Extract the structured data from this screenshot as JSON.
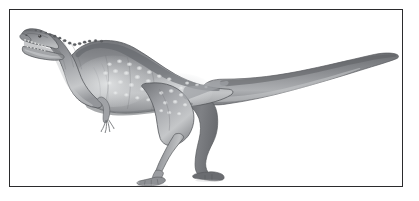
{
  "figure": {
    "kind": "scientific-illustration",
    "subject_label": "Abelisaurid theropod dinosaur in left-facing lateral profile",
    "caption": "",
    "title": "",
    "rendering": "grayscale pencil and airbrush shading",
    "background_color": "#ffffff",
    "page_background_color": "#ffffff"
  },
  "frame": {
    "label": "illustration border",
    "border_color": "#2b2b2d",
    "border_width_px": 1.6,
    "x": 9,
    "y": 9,
    "width": 394,
    "height": 178,
    "fill": "#ffffff"
  },
  "palette": {
    "outline": "#4a4a4c",
    "body_dark": "#6f7073",
    "body_mid": "#8e9093",
    "body_light": "#b4b6b8",
    "body_highlight": "#d2d4d5",
    "belly_shadow": "#7b7d80",
    "spot_color": "#e0e2e3",
    "tooth_color": "#f2f2f2",
    "eye_color": "#3a3a3c",
    "claw_color": "#9a9c9e"
  },
  "anatomy": {
    "parts": [
      {
        "name": "skull",
        "label": "Skull with open jaws",
        "note": "boxy abelisaurid skull, rugose upper surface"
      },
      {
        "name": "upper-jaw",
        "label": "Upper jaw",
        "note": "angled upward, lined with conical teeth"
      },
      {
        "name": "lower-jaw",
        "label": "Lower jaw",
        "note": "dropped open, gape roughly 45 degrees"
      },
      {
        "name": "eye",
        "label": "Eye",
        "note": "small dark dot behind the nares"
      },
      {
        "name": "neck",
        "label": "Neck",
        "note": "thick, S-curved, bearing a row of low dorsal bumps"
      },
      {
        "name": "torso",
        "label": "Torso",
        "note": "barrel chest, light speckled flank pattern"
      },
      {
        "name": "forelimb",
        "label": "Forelimb",
        "note": "very short arm with four stubby clawed digits"
      },
      {
        "name": "near-hindlimb",
        "label": "Near hind limb",
        "note": "forward, weight-bearing, three-toed foot"
      },
      {
        "name": "far-hindlimb",
        "label": "Far hind limb",
        "note": "rear, partially shaded, three-toed foot"
      },
      {
        "name": "tail",
        "label": "Tail",
        "note": "long, thick-based, tapering to a fine point at the right"
      },
      {
        "name": "dorsal-ridge",
        "label": "Dorsal ridge",
        "note": "row of small osteoderm-like bumps over the neck and shoulders"
      },
      {
        "name": "flank-spots",
        "label": "Flank spots",
        "note": "rows of pale oval spots over the ribs, hip and thigh"
      }
    ],
    "orientation": "facing left",
    "pose": "standing, striding, mouth open"
  },
  "composition": {
    "subject_bounds": {
      "x": 24,
      "y": 26,
      "width": 368,
      "height": 150
    },
    "head_position": {
      "x": 30,
      "y": 29
    },
    "tail_tip_position": {
      "x": 391,
      "y": 92
    },
    "ground_line_y": 176
  }
}
